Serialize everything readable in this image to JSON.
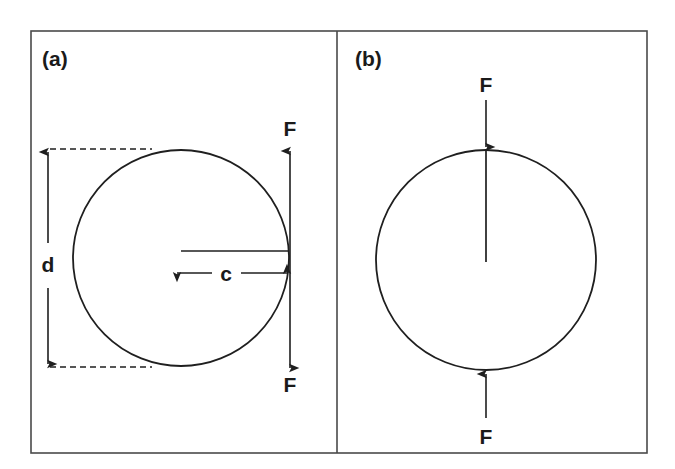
{
  "figure": {
    "type": "technical-line-diagram",
    "background_color": "#ffffff",
    "line_color": "#1f1f1f",
    "frame_color": "#4a4a4a",
    "width": 675,
    "height": 469
  },
  "panels": [
    {
      "id": "a",
      "label": "(a)",
      "description": "disc with radial edge crack of length c under diametral load F",
      "specimen": {
        "shape": "circle",
        "center_x": 181,
        "center_y": 258,
        "radius": 108
      },
      "dimensions": [
        {
          "name": "d",
          "label": "d",
          "meaning": "disc diameter",
          "orientation": "vertical",
          "label_x": 48,
          "label_y": 265
        },
        {
          "name": "c",
          "label": "c",
          "meaning": "crack length",
          "orientation": "horizontal",
          "label_x": 226,
          "label_y": 279
        }
      ],
      "forces": [
        {
          "label": "F",
          "direction": "up",
          "label_x": 290,
          "label_y": 136
        },
        {
          "label": "F",
          "direction": "down",
          "label_x": 290,
          "label_y": 390
        }
      ]
    },
    {
      "id": "b",
      "label": "(b)",
      "description": "disc with central crack initiating from loading point under diametral load F",
      "specimen": {
        "shape": "circle",
        "center_x": 486,
        "center_y": 260,
        "radius": 110
      },
      "dimensions": [],
      "forces": [
        {
          "label": "F",
          "direction": "down",
          "label_x": 486,
          "label_y": 92
        },
        {
          "label": "F",
          "direction": "up",
          "label_x": 486,
          "label_y": 444
        }
      ]
    }
  ]
}
